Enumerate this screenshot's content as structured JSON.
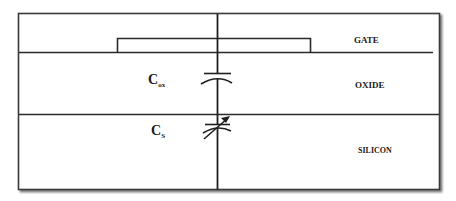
{
  "diagram": {
    "layers": [
      {
        "id": "gate",
        "label": "GATE"
      },
      {
        "id": "oxide",
        "label": "OXIDE"
      },
      {
        "id": "silicon",
        "label": "SILICON"
      }
    ],
    "capacitors": [
      {
        "id": "cox",
        "symbol": "C",
        "subscript": "ox",
        "type": "fixed"
      },
      {
        "id": "cs",
        "symbol": "C",
        "subscript": "S",
        "type": "variable"
      }
    ],
    "colors": {
      "line": "#2a2a2a",
      "border": "#3a3a3a",
      "shadow": "#9a9a9a",
      "background": "#ffffff",
      "text": "#1a1a1a"
    }
  }
}
